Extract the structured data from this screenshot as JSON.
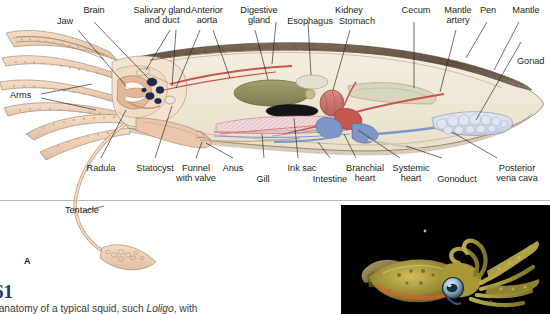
{
  "figure": {
    "panel_letter": "A",
    "number": "61",
    "caption": "f anatomy of a typical squid, such Loligo, with",
    "caption_italic_term": "Loligo"
  },
  "diagram": {
    "labels_top": [
      {
        "id": "brain",
        "text": "Brain"
      },
      {
        "id": "jaw",
        "text": "Jaw"
      },
      {
        "id": "salivary-gland",
        "text": "Salivary gland\nand duct"
      },
      {
        "id": "anterior-aorta",
        "text": "Anterior\naorta"
      },
      {
        "id": "digestive-gland",
        "text": "Digestive\ngland"
      },
      {
        "id": "esophagus",
        "text": "Esophagus"
      },
      {
        "id": "kidney",
        "text": "Kidney"
      },
      {
        "id": "stomach",
        "text": "Stomach"
      },
      {
        "id": "cecum",
        "text": "Cecum"
      },
      {
        "id": "mantle-artery",
        "text": "Mantle\nartery"
      },
      {
        "id": "pen",
        "text": "Pen"
      },
      {
        "id": "mantle",
        "text": "Mantle"
      },
      {
        "id": "gonad",
        "text": "Gonad"
      }
    ],
    "labels_left": [
      {
        "id": "arms",
        "text": "Arms"
      },
      {
        "id": "tentacle",
        "text": "Tentacle"
      }
    ],
    "labels_bottom": [
      {
        "id": "radula",
        "text": "Radula"
      },
      {
        "id": "statocyst",
        "text": "Statocyst"
      },
      {
        "id": "funnel",
        "text": "Funnel\nwith valve"
      },
      {
        "id": "anus",
        "text": "Anus"
      },
      {
        "id": "gill",
        "text": "Gill"
      },
      {
        "id": "ink-sac",
        "text": "Ink sac"
      },
      {
        "id": "intestine",
        "text": "Intestine"
      },
      {
        "id": "branchial-heart",
        "text": "Branchial\nheart"
      },
      {
        "id": "systemic-heart",
        "text": "Systemic\nheart"
      },
      {
        "id": "gonoduct",
        "text": "Gonoduct"
      },
      {
        "id": "posterior-vena-cava",
        "text": "Posterior\nvena cava"
      }
    ],
    "colors": {
      "mantle_wall": "#6d5b4b",
      "body_cavity": "#f0ead9",
      "digestive_gland": "#8b8a5e",
      "ink_sac": "#1a1a1a",
      "artery_red": "#c8554e",
      "vein_blue": "#6f8fc4",
      "gonad": "#ccd3e2",
      "arms_tan": "#e8cdb4",
      "gill_pink": "#e3b3b6"
    }
  },
  "photograph": {
    "id": "squid-photo",
    "alt": "Live squid photographed against black water",
    "background": "#000000"
  }
}
